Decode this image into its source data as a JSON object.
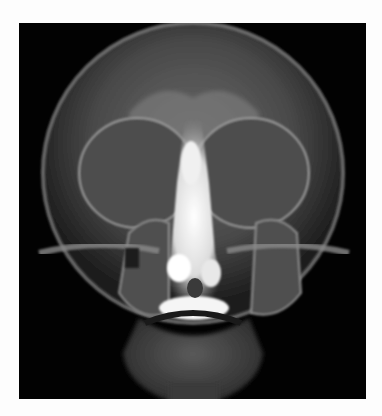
{
  "caption_fragment": "",
  "image": {
    "subject": "frontal skull x-ray (paranasal sinuses view)",
    "background_color": "#020202",
    "page_background": "#fdfdfd"
  }
}
